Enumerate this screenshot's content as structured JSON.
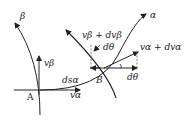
{
  "diagram": {
    "type": "slip-line field velocity diagram",
    "curves": {
      "beta": "β",
      "alpha": "α"
    },
    "points": {
      "A": "A",
      "B": "B"
    },
    "labels": {
      "v_beta_A": "vβ",
      "v_alpha_A": "vα",
      "ds_alpha": "dsα",
      "v_beta_B": "vβ + dvβ",
      "v_alpha_B": "vα + dvα",
      "dtheta_top": "dθ",
      "dtheta_bottom": "dθ"
    },
    "colors": {
      "stroke": "#222222",
      "dash": "#555555",
      "background": "#ffffff"
    }
  }
}
